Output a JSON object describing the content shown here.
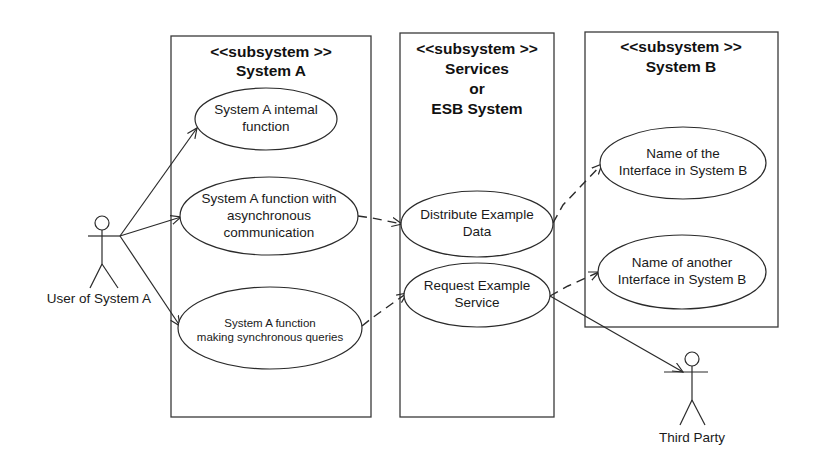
{
  "diagram": {
    "type": "UML use case diagram",
    "subsystems": [
      {
        "id": "system_a",
        "stereotype": "<<subsystem >>",
        "name_lines": [
          "System A"
        ]
      },
      {
        "id": "services",
        "stereotype": "<<subsystem >>",
        "name_lines": [
          "Services",
          "or",
          "ESB System"
        ]
      },
      {
        "id": "system_b",
        "stereotype": "<<subsystem >>",
        "name_lines": [
          "System B"
        ]
      }
    ],
    "use_cases": {
      "internal": {
        "lines": [
          "System A intemal",
          "function"
        ]
      },
      "async": {
        "lines": [
          "System A function with",
          "asynchronous",
          "communication"
        ]
      },
      "sync": {
        "lines": [
          "System A function",
          "making synchronous queries"
        ]
      },
      "distribute": {
        "lines": [
          "Distribute Example",
          "Data"
        ]
      },
      "request": {
        "lines": [
          "Request Example",
          "Service"
        ]
      },
      "iface_b": {
        "lines": [
          "Name of the",
          "Interface in System B"
        ]
      },
      "iface_b2": {
        "lines": [
          "Name of another",
          "Interface in System B"
        ]
      }
    },
    "actors": {
      "user_a": {
        "label": "User of System A"
      },
      "third_party": {
        "label": "Third Party"
      }
    },
    "relations": [
      {
        "from": "User of System A",
        "to": "System A intemal function",
        "style": "solid-arrow"
      },
      {
        "from": "User of System A",
        "to": "System A function with asynchronous communication",
        "style": "solid-arrow"
      },
      {
        "from": "User of System A",
        "to": "System A function making synchronous queries",
        "style": "solid-arrow"
      },
      {
        "from": "System A function with asynchronous communication",
        "to": "Distribute Example Data",
        "style": "dashed-arrow"
      },
      {
        "from": "System A function making synchronous queries",
        "to": "Request Example Service",
        "style": "dashed-arrow"
      },
      {
        "from": "Distribute Example Data",
        "to": "Name of the Interface in System B",
        "style": "dashed-arrow"
      },
      {
        "from": "Request Example Service",
        "to": "Name of another Interface in System B",
        "style": "dashed-arrow"
      },
      {
        "from": "Request Example Service",
        "to": "Third Party",
        "style": "solid-arrow"
      }
    ]
  }
}
